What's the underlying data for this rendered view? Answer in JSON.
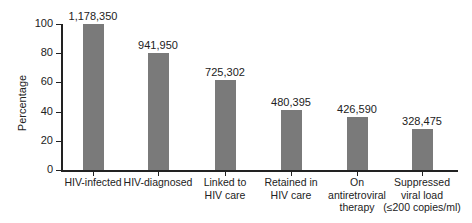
{
  "chart_data": {
    "type": "bar",
    "title": "",
    "xlabel": "",
    "ylabel": "Percentage",
    "ylim": [
      0,
      100
    ],
    "yticks": [
      0,
      20,
      40,
      60,
      80,
      100
    ],
    "grid": false,
    "legend": null,
    "categories": [
      "HIV-infected",
      "HIV-diagnosed",
      "Linked to HIV care",
      "Retained in HIV care",
      "On antiretroviral therapy",
      "Suppressed viral load (≤200 copies/ml)"
    ],
    "category_lines": [
      [
        "HIV-infected"
      ],
      [
        "HIV-diagnosed"
      ],
      [
        "Linked to",
        "HIV care"
      ],
      [
        "Retained in",
        "HIV care"
      ],
      [
        "On",
        "antiretroviral",
        "therapy"
      ],
      [
        "Suppressed",
        "viral load",
        "(≤200 copies/ml)"
      ]
    ],
    "values": [
      100,
      79.9,
      61.6,
      40.8,
      36.2,
      27.9
    ],
    "data_labels": [
      "1,178,350",
      "941,950",
      "725,302",
      "480,395",
      "426,590",
      "328,475"
    ],
    "bar_color": "#7a7a7a"
  }
}
